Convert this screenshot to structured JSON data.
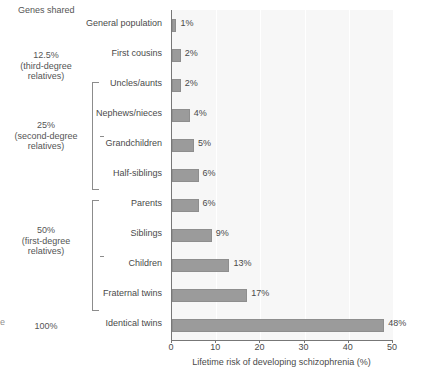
{
  "figure": {
    "genes_shared_header": "Genes shared",
    "edge_mark": "e",
    "groups": [
      {
        "id": "third-degree",
        "lines": [
          "12.5%",
          "(third-degree",
          "relatives)"
        ],
        "has_bracket": false,
        "top": 50,
        "label_top": 50
      },
      {
        "id": "second-degree",
        "lines": [
          "25%",
          "(second-degree",
          "relatives)"
        ],
        "has_bracket": true,
        "bracket_top": 82,
        "bracket_height": 108,
        "label_top": 120
      },
      {
        "id": "first-degree",
        "lines": [
          "50%",
          "(first-degree",
          "relatives)"
        ],
        "has_bracket": true,
        "bracket_top": 200,
        "bracket_height": 111,
        "label_top": 225
      },
      {
        "id": "identical",
        "lines": [
          "100%"
        ],
        "has_bracket": false,
        "label_top": 321
      }
    ]
  },
  "chart_data": {
    "type": "bar",
    "orientation": "horizontal",
    "title": "",
    "xlabel": "Lifetime risk of developing schizophrenia (%)",
    "ylabel": "",
    "xlim": [
      0,
      50
    ],
    "xticks": [
      0,
      10,
      20,
      30,
      40,
      50
    ],
    "xtick_labels": [
      "0",
      "10",
      "20",
      "30",
      "40",
      "50"
    ],
    "grid": "vertical",
    "legend": "none",
    "bar_color": "#9b9b9b",
    "plot_background": "#f7f7f7",
    "categories": [
      "General population",
      "First cousins",
      "Uncles/aunts",
      "Nephews/nieces",
      "Grandchildren",
      "Half-siblings",
      "Parents",
      "Siblings",
      "Children",
      "Fraternal twins",
      "Identical twins"
    ],
    "values": [
      1,
      2,
      2,
      4,
      5,
      6,
      6,
      9,
      13,
      17,
      48
    ],
    "data_labels": [
      "1%",
      "2%",
      "2%",
      "4%",
      "5%",
      "6%",
      "6%",
      "9%",
      "13%",
      "17%",
      "48%"
    ]
  }
}
